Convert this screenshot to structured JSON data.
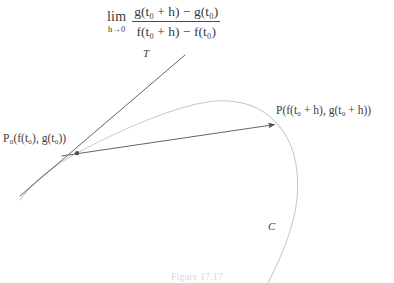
{
  "figure": {
    "caption": "Figure 17.17",
    "limit_expression": {
      "operator": "lim",
      "subscript": "h→0",
      "numerator": "g(t₀ + h) − g(t₀)",
      "denominator": "f(t₀ + h) − f(t₀)"
    },
    "labels": {
      "tangent_line": "T",
      "curve": "C",
      "point_p0": "P₀(f(t₀), g(t₀))",
      "point_p": "P(f(t₀ + h), g(t₀ + h))"
    },
    "colors": {
      "curve_stroke": "#c9c9c9",
      "line_stroke": "#595959",
      "text": "#3c3c3c",
      "background": "#ffffff",
      "caption_text": "#d8d8d8"
    },
    "geometry": {
      "point_p0": [
        77,
        153
      ],
      "point_p": [
        277,
        124
      ],
      "tangent_line": [
        [
          20,
          196
        ],
        [
          185,
          55
        ]
      ],
      "secant_line": [
        [
          62,
          155
        ],
        [
          277,
          124
        ]
      ],
      "curve_apex": [
        235,
        103
      ],
      "curve_right_bulge": [
        298,
        200
      ]
    }
  }
}
